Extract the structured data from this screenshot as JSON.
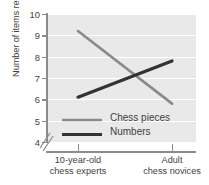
{
  "chart_data": {
    "type": "line",
    "title": "",
    "xlabel": "",
    "ylabel": "Number of items recalled",
    "categories": [
      "10-year-old chess experts",
      "Adult chess novices"
    ],
    "category_lines": [
      [
        "10-year-old",
        "chess experts"
      ],
      [
        "Adult",
        "chess novices"
      ]
    ],
    "ylim": [
      4,
      10
    ],
    "yticks": [
      4,
      5,
      6,
      7,
      8,
      9,
      10
    ],
    "ytick_labels": [
      "4",
      "5",
      "6",
      "7",
      "8",
      "9",
      "10"
    ],
    "y_axis_break": true,
    "grid": "horizontal",
    "legend_position": "inside-lower-center",
    "plot_background": "#e9e9e9",
    "gridline_color": "#ffffff",
    "axis_color": "#8c8c8c",
    "series": [
      {
        "name": "Chess pieces",
        "values": [
          9.2,
          5.8
        ],
        "color": "#8a8a8a",
        "width": 2.6
      },
      {
        "name": "Numbers",
        "values": [
          6.1,
          7.8
        ],
        "color": "#333333",
        "width": 3.2
      }
    ],
    "annotations": {
      "crossing_value": 7.1
    }
  }
}
